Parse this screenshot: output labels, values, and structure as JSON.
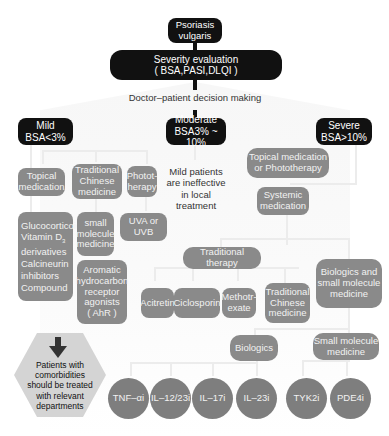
{
  "top": {
    "root": "Psoriasis vulgaris",
    "root_line1": "Psoriasis",
    "root_line2": "vulgaris",
    "severity_line1": "Severity evaluation",
    "severity_line2": "( BSA,PASI,DLQI )",
    "decision": "Doctor–patient decision making"
  },
  "levels": {
    "mild_line1": "Mild",
    "mild_line2": "BSA<3%",
    "moderate_line1": "Moderate",
    "moderate_line2": "BSA3% ~ 10%",
    "severe_line1": "Severe",
    "severe_line2": "BSA>10%"
  },
  "mild": {
    "topical_l1": "Topical",
    "topical_l2": "medication",
    "tcm_l1": "Traditional",
    "tcm_l2": "Chinese",
    "tcm_l3": "medicine",
    "photo_l1": "Photot-",
    "photo_l2": "herapy",
    "gluco_l1": "Glucocorticoid",
    "gluco_l2": "Vitamin D",
    "gluco_l2_sub": "3",
    "gluco_l3": "derivatives",
    "gluco_l4": "Calcineurin",
    "gluco_l5": "inhibitors",
    "gluco_l6": "Compound",
    "small_l1": "small",
    "small_l2": "molecule",
    "small_l3": "medicine",
    "ahr_l1": "Aromatic",
    "ahr_l2": "hydrocarbon",
    "ahr_l3": "receptor",
    "ahr_l4": "agonists",
    "ahr_l5": "( AhR )",
    "uv_l1": "UVA  or",
    "uv_l2": "UVB"
  },
  "moderate": {
    "note_l1": "Mild patients",
    "note_l2": "are ineffective",
    "note_l3": "in local treatment"
  },
  "severe": {
    "topphoto_l1": "Topical medication",
    "topphoto_l2": "or Phototherapy",
    "systemic_l1": "Systemic",
    "systemic_l2": "medication",
    "traditional_therapy": "Traditional therapy",
    "acitretin": "Acitretin",
    "ciclosporin": "Ciclosporin",
    "mtx_l1": "Methotr-",
    "mtx_l2": "exate",
    "tcm_l1": "Traditional",
    "tcm_l2": "Chinese",
    "tcm_l3": "medicine",
    "bio_small_l1": "Biologics and",
    "bio_small_l2": "small molecule",
    "bio_small_l3": "medicine",
    "biologics": "Biologics",
    "smallmol_l1": "Small molecule",
    "smallmol_l2": "medicine"
  },
  "circles": [
    "TNF–αi",
    "IL–12/23i",
    "IL–17i",
    "IL–23i",
    "TYK2i",
    "PDE4i"
  ],
  "comorbidity": {
    "l1": "Patients with",
    "l2": "comorbidities",
    "l3": "should be treated",
    "l4": "with relevant",
    "l5": "departments"
  },
  "colors": {
    "dark_node": "#111111",
    "grey_node": "#8a8a8a",
    "circle_node": "#7e7e7e",
    "hexagon": "#d4d4d4",
    "connector": "#ececec"
  }
}
